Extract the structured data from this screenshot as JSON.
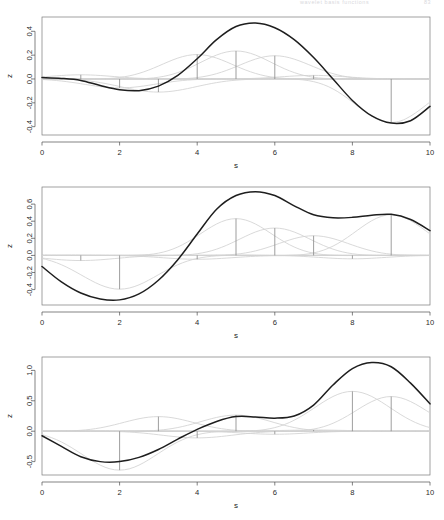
{
  "running_head": {
    "center": "wavelet basis functions",
    "page_number": "83"
  },
  "figure": {
    "panel_count": 3,
    "x_axis_label": "s",
    "y_axis_label": "z",
    "curve_colors": {
      "main": "#1e1e1e",
      "basis": "#d2d2d2",
      "spike": "#8c8c8c",
      "box": "#7a7a7a"
    }
  },
  "chart_data": [
    {
      "type": "line",
      "title": "",
      "xlabel": "s",
      "ylabel": "z",
      "xlim": [
        0,
        10
      ],
      "ylim": [
        -0.47,
        0.52
      ],
      "xticks": [
        0,
        2,
        4,
        6,
        8,
        10
      ],
      "yticks": [
        -0.4,
        -0.2,
        0.0,
        0.2,
        0.4
      ],
      "xticklabels": [
        "0",
        "2",
        "4",
        "6",
        "8",
        "10"
      ],
      "yticklabels": [
        "-0.4",
        "-0.2",
        "0.0",
        "0.2",
        "0.4"
      ],
      "grid": false,
      "legend": "none",
      "series": [
        {
          "name": "resultant",
          "style": "solid-dark",
          "x": [
            0,
            0.5,
            1,
            1.5,
            2,
            2.5,
            3,
            3.5,
            4,
            4.5,
            5,
            5.5,
            6,
            6.5,
            7,
            7.5,
            8,
            8.5,
            9,
            9.5,
            10
          ],
          "values": [
            0.012,
            0.005,
            -0.012,
            -0.055,
            -0.09,
            -0.098,
            -0.06,
            0.03,
            0.17,
            0.33,
            0.44,
            0.47,
            0.43,
            0.33,
            0.18,
            0.0,
            -0.18,
            -0.31,
            -0.37,
            -0.35,
            -0.23
          ]
        }
      ],
      "spikes": {
        "name": "wavelet coefficients",
        "x": [
          1,
          2,
          3,
          4,
          5,
          6,
          7,
          9
        ],
        "values": [
          0.035,
          -0.075,
          -0.11,
          0.205,
          0.235,
          0.195,
          0.03,
          -0.365
        ]
      },
      "basis_curves": {
        "name": "scaled basis functions",
        "count": 8,
        "centers": [
          1,
          2,
          3,
          4,
          5,
          6,
          7,
          9
        ],
        "amplitudes": [
          0.035,
          -0.075,
          -0.11,
          0.205,
          0.235,
          0.195,
          0.03,
          -0.365
        ],
        "widths": [
          1.4,
          1.5,
          1.6,
          1.5,
          1.5,
          1.5,
          1.4,
          1.5
        ]
      }
    },
    {
      "type": "line",
      "title": "",
      "xlabel": "s",
      "ylabel": "z",
      "xlim": [
        0,
        10
      ],
      "ylim": [
        -0.58,
        0.8
      ],
      "xticks": [
        0,
        2,
        4,
        6,
        8,
        10
      ],
      "yticks": [
        -0.4,
        -0.2,
        0.0,
        0.2,
        0.4,
        0.6
      ],
      "xticklabels": [
        "0",
        "2",
        "4",
        "6",
        "8",
        "10"
      ],
      "yticklabels": [
        "-0.4",
        "-0.2",
        "0.0",
        "0.2",
        "0.4",
        "0.6"
      ],
      "grid": false,
      "legend": "none",
      "series": [
        {
          "name": "resultant",
          "style": "solid-dark",
          "x": [
            0,
            0.5,
            1,
            1.5,
            2,
            2.5,
            3,
            3.5,
            4,
            4.5,
            5,
            5.5,
            6,
            6.5,
            7,
            7.5,
            8,
            8.5,
            9,
            9.5,
            10
          ],
          "values": [
            -0.13,
            -0.31,
            -0.44,
            -0.51,
            -0.52,
            -0.45,
            -0.29,
            -0.05,
            0.25,
            0.54,
            0.7,
            0.745,
            0.7,
            0.58,
            0.475,
            0.44,
            0.445,
            0.47,
            0.48,
            0.42,
            0.29
          ]
        }
      ],
      "spikes": {
        "name": "wavelet coefficients",
        "x": [
          1,
          2,
          4,
          5,
          6,
          7,
          8,
          9
        ],
        "values": [
          -0.06,
          -0.395,
          -0.045,
          0.43,
          0.32,
          0.23,
          -0.04,
          0.475
        ]
      },
      "basis_curves": {
        "name": "scaled basis functions",
        "count": 8,
        "centers": [
          1,
          2,
          4,
          5,
          6,
          7,
          8,
          9
        ],
        "amplitudes": [
          -0.06,
          -0.395,
          -0.045,
          0.43,
          0.32,
          0.23,
          -0.04,
          0.475
        ],
        "widths": [
          1.5,
          1.6,
          1.5,
          1.5,
          1.5,
          1.5,
          1.4,
          1.5
        ]
      }
    },
    {
      "type": "line",
      "title": "",
      "xlabel": "s",
      "ylabel": "z",
      "xlim": [
        0,
        10
      ],
      "ylim": [
        -0.72,
        1.22
      ],
      "xticks": [
        0,
        2,
        4,
        6,
        8,
        10
      ],
      "yticks": [
        -0.5,
        0.0,
        0.5,
        1.0
      ],
      "xticklabels": [
        "0",
        "2",
        "4",
        "6",
        "8",
        "10"
      ],
      "yticklabels": [
        "-0.5",
        "0.0",
        "0.5",
        "1.0"
      ],
      "grid": false,
      "legend": "none",
      "series": [
        {
          "name": "resultant",
          "style": "solid-dark",
          "x": [
            0,
            0.5,
            1,
            1.5,
            2,
            2.5,
            3,
            3.5,
            4,
            4.5,
            5,
            5.5,
            6,
            6.5,
            7,
            7.5,
            8,
            8.5,
            9,
            9.5,
            10
          ],
          "values": [
            -0.075,
            -0.25,
            -0.42,
            -0.5,
            -0.5,
            -0.43,
            -0.3,
            -0.13,
            0.03,
            0.16,
            0.24,
            0.235,
            0.215,
            0.25,
            0.43,
            0.76,
            1.03,
            1.13,
            1.06,
            0.79,
            0.45
          ]
        }
      ],
      "spikes": {
        "name": "wavelet coefficients",
        "x": [
          2,
          3,
          4,
          5,
          6,
          7,
          8,
          9
        ],
        "values": [
          -0.64,
          0.24,
          -0.11,
          0.265,
          -0.05,
          0.02,
          0.655,
          0.57
        ]
      },
      "basis_curves": {
        "name": "scaled basis functions",
        "count": 8,
        "centers": [
          2,
          3,
          4,
          5,
          6,
          7,
          8,
          9
        ],
        "amplitudes": [
          -0.64,
          0.24,
          -0.11,
          0.265,
          -0.05,
          0.02,
          0.655,
          0.57
        ],
        "widths": [
          1.6,
          1.5,
          1.5,
          1.5,
          1.4,
          1.4,
          1.6,
          1.5
        ]
      }
    }
  ]
}
